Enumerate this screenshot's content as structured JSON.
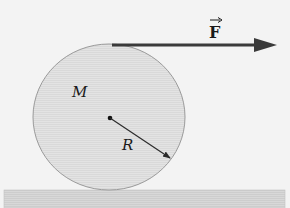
{
  "diagram": {
    "labels": {
      "mass": "M",
      "radius": "R",
      "force": "F",
      "force_vector_mark": "→"
    },
    "colors": {
      "background": "#f3f3f3",
      "cylinder_fill": "#e0e0e0",
      "cylinder_stroke": "#9a9a9a",
      "ground_fill": "#d6d6d6",
      "arrow": "#3a3a3a",
      "text": "#1a1a1a"
    }
  }
}
